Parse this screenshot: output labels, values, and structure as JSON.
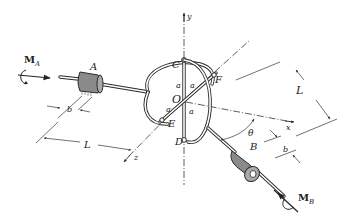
{
  "figure": {
    "labels": {
      "moment_a": "M",
      "moment_a_sub": "A",
      "moment_b": "M",
      "moment_b_sub": "B",
      "bearing_a": "A",
      "bearing_b": "B",
      "point_c": "C",
      "point_d": "D",
      "point_e": "E",
      "point_f": "F",
      "origin": "O",
      "angle": "θ",
      "axis_x": "x",
      "axis_y": "y",
      "axis_z": "z",
      "dim_length_left": "L",
      "dim_length_right": "L",
      "dim_b_left": "b",
      "dim_b_right": "b",
      "seg_a_1": "a",
      "seg_a_2": "a",
      "seg_a_3": "a",
      "seg_a_4": "a"
    },
    "colors": {
      "line": "#2a2a2a",
      "bearing_fill": "#8a8a8a",
      "background": "#ffffff"
    }
  }
}
